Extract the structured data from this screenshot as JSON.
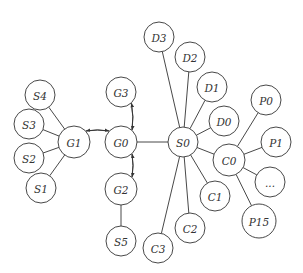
{
  "diagram": {
    "type": "graph",
    "nodes": [
      {
        "id": "S4",
        "label": "S4",
        "x": 40,
        "y": 95,
        "r": 15
      },
      {
        "id": "S3",
        "label": "S3",
        "x": 29,
        "y": 124,
        "r": 15
      },
      {
        "id": "S2",
        "label": "S2",
        "x": 29,
        "y": 158,
        "r": 15
      },
      {
        "id": "S1",
        "label": "S1",
        "x": 41,
        "y": 188,
        "r": 15
      },
      {
        "id": "G1",
        "label": "G1",
        "x": 74,
        "y": 142,
        "r": 16
      },
      {
        "id": "G0",
        "label": "G0",
        "x": 121,
        "y": 142,
        "r": 16
      },
      {
        "id": "G3",
        "label": "G3",
        "x": 121,
        "y": 92,
        "r": 15
      },
      {
        "id": "G2",
        "label": "G2",
        "x": 121,
        "y": 189,
        "r": 16
      },
      {
        "id": "S5",
        "label": "S5",
        "x": 121,
        "y": 241,
        "r": 15
      },
      {
        "id": "S0",
        "label": "S0",
        "x": 183,
        "y": 142,
        "r": 15
      },
      {
        "id": "D3",
        "label": "D3",
        "x": 159,
        "y": 37,
        "r": 15
      },
      {
        "id": "D2",
        "label": "D2",
        "x": 190,
        "y": 57,
        "r": 15
      },
      {
        "id": "D1",
        "label": "D1",
        "x": 212,
        "y": 87,
        "r": 15
      },
      {
        "id": "D0",
        "label": "D0",
        "x": 224,
        "y": 121,
        "r": 15
      },
      {
        "id": "C0",
        "label": "C0",
        "x": 229,
        "y": 160,
        "r": 16
      },
      {
        "id": "C1",
        "label": "C1",
        "x": 215,
        "y": 196,
        "r": 15
      },
      {
        "id": "C2",
        "label": "C2",
        "x": 190,
        "y": 228,
        "r": 15
      },
      {
        "id": "C3",
        "label": "C3",
        "x": 158,
        "y": 248,
        "r": 15
      },
      {
        "id": "P0",
        "label": "P0",
        "x": 266,
        "y": 100,
        "r": 15
      },
      {
        "id": "P1",
        "label": "P1",
        "x": 276,
        "y": 142,
        "r": 15
      },
      {
        "id": "Pdots",
        "label": "...",
        "x": 270,
        "y": 182,
        "r": 15
      },
      {
        "id": "P15",
        "label": "P15",
        "x": 259,
        "y": 221,
        "r": 17
      }
    ],
    "edges": [
      {
        "from": "S4",
        "to": "G1",
        "directed": false
      },
      {
        "from": "S3",
        "to": "G1",
        "directed": false
      },
      {
        "from": "S2",
        "to": "G1",
        "directed": false
      },
      {
        "from": "S1",
        "to": "G1",
        "directed": false
      },
      {
        "from": "G1",
        "to": "G0",
        "directed": true,
        "curve": "upper"
      },
      {
        "from": "G0",
        "to": "G1",
        "directed": true,
        "curve": "lower"
      },
      {
        "from": "G3",
        "to": "G0",
        "directed": true,
        "curve": "right"
      },
      {
        "from": "G0",
        "to": "G3",
        "directed": true,
        "curve": "left"
      },
      {
        "from": "G0",
        "to": "G2",
        "directed": true,
        "curve": "right"
      },
      {
        "from": "G2",
        "to": "G0",
        "directed": true,
        "curve": "left"
      },
      {
        "from": "G2",
        "to": "S5",
        "directed": false
      },
      {
        "from": "G0",
        "to": "S0",
        "directed": false
      },
      {
        "from": "S0",
        "to": "D3",
        "directed": false
      },
      {
        "from": "S0",
        "to": "D2",
        "directed": false
      },
      {
        "from": "S0",
        "to": "D1",
        "directed": false
      },
      {
        "from": "S0",
        "to": "D0",
        "directed": false
      },
      {
        "from": "S0",
        "to": "C0",
        "directed": false
      },
      {
        "from": "S0",
        "to": "C1",
        "directed": false
      },
      {
        "from": "S0",
        "to": "C2",
        "directed": false
      },
      {
        "from": "S0",
        "to": "C3",
        "directed": false
      },
      {
        "from": "C0",
        "to": "P0",
        "directed": false
      },
      {
        "from": "C0",
        "to": "P1",
        "directed": false
      },
      {
        "from": "C0",
        "to": "Pdots",
        "directed": false
      },
      {
        "from": "C0",
        "to": "P15",
        "directed": false
      }
    ]
  },
  "colors": {
    "stroke": "#333333",
    "background": "#ffffff"
  }
}
